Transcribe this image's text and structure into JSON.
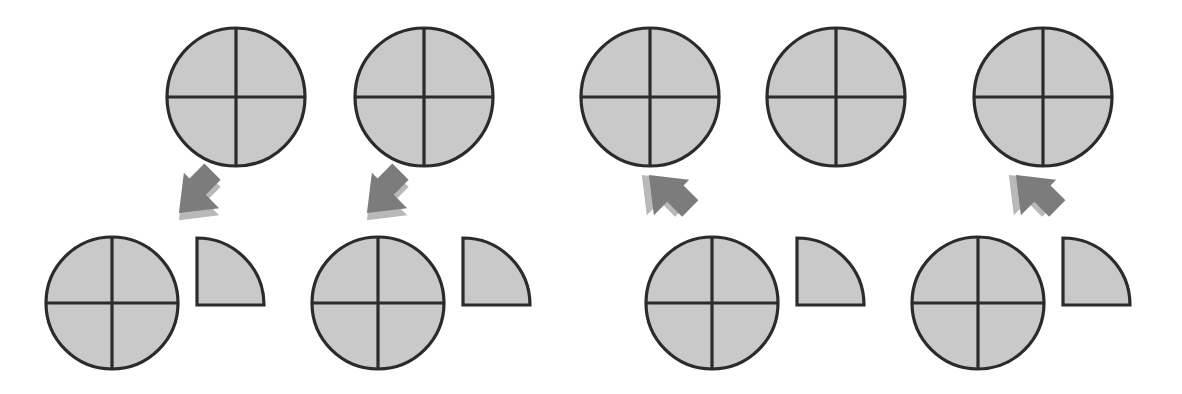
{
  "canvas": {
    "width": 1182,
    "height": 394,
    "background_color": "#ffffff",
    "title": "Quartered circle fraction diagram"
  },
  "style": {
    "shape_fill": "#c9c9c9",
    "shape_stroke": "#2b2b2b",
    "shape_stroke_width": 3.2,
    "divider_stroke": "#2b2b2b",
    "divider_stroke_width": 3.2,
    "arrow_fill": "#7c7c7c",
    "arrow_shadow": "#b9b9b9",
    "arrow_shadow_offset": 5
  },
  "diagram": {
    "kind": "fraction-partition",
    "top_row": {
      "label": "whole-circles-row",
      "count": 5,
      "center_y": 97,
      "radius": 69,
      "divisions": 4,
      "division_style": "cross",
      "circles": [
        {
          "index": 1,
          "cx": 236,
          "cy": 97,
          "r": 69,
          "parts": 4
        },
        {
          "index": 2,
          "cx": 424,
          "cy": 97,
          "r": 69,
          "parts": 4
        },
        {
          "index": 3,
          "cx": 650,
          "cy": 97,
          "r": 69,
          "parts": 4
        },
        {
          "index": 4,
          "cx": 836,
          "cy": 97,
          "r": 69,
          "parts": 4
        },
        {
          "index": 5,
          "cx": 1043,
          "cy": 97,
          "r": 69,
          "parts": 4
        }
      ]
    },
    "arrows": {
      "label": "transition-arrows-row",
      "count": 4,
      "items": [
        {
          "index": 1,
          "cx": 198,
          "cy": 194,
          "direction": "down-left",
          "rotation": 225
        },
        {
          "index": 2,
          "cx": 386,
          "cy": 194,
          "direction": "down-left",
          "rotation": 225
        },
        {
          "index": 3,
          "cx": 668,
          "cy": 194,
          "direction": "down-right",
          "rotation": 315
        },
        {
          "index": 4,
          "cx": 1035,
          "cy": 194,
          "direction": "down-right",
          "rotation": 315
        }
      ]
    },
    "bottom_row": {
      "label": "partitioned-circles-row",
      "count": 4,
      "center_y": 303,
      "radius": 66,
      "groups": [
        {
          "index": 1,
          "circle": {
            "cx": 112,
            "cy": 303,
            "r": 66,
            "parts": 4
          },
          "wedge": {
            "x": 197,
            "y": 238,
            "size": 67,
            "corner": "bottom-left",
            "fraction": "1/4"
          }
        },
        {
          "index": 2,
          "circle": {
            "cx": 378,
            "cy": 303,
            "r": 66,
            "parts": 4
          },
          "wedge": {
            "x": 463,
            "y": 238,
            "size": 67,
            "corner": "bottom-left",
            "fraction": "1/4"
          }
        },
        {
          "index": 3,
          "circle": {
            "cx": 712,
            "cy": 303,
            "r": 66,
            "parts": 4
          },
          "wedge": {
            "x": 797,
            "y": 238,
            "size": 67,
            "corner": "bottom-left",
            "fraction": "1/4"
          }
        },
        {
          "index": 4,
          "circle": {
            "cx": 978,
            "cy": 303,
            "r": 66,
            "parts": 4
          },
          "wedge": {
            "x": 1063,
            "y": 238,
            "size": 67,
            "corner": "bottom-left",
            "fraction": "1/4"
          }
        }
      ]
    }
  }
}
